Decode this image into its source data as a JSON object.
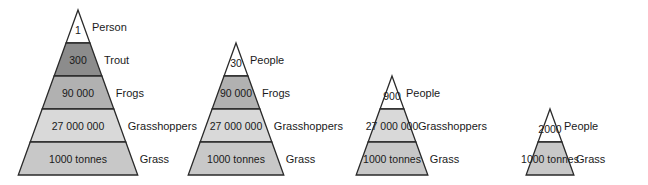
{
  "colors": {
    "outline": "#2a2a2a",
    "apex": "#ffffff",
    "trout": "#8c8c8c",
    "frogs": "#b1b1b1",
    "grasshoppers": "#d9d9d9",
    "grass": "#c8c8c8"
  },
  "pyramids": [
    {
      "id": "five-level",
      "apex_x": 78,
      "levels": [
        {
          "value": "1",
          "organism": "Person",
          "color_key": "apex"
        },
        {
          "value": "300",
          "organism": "Trout",
          "color_key": "trout"
        },
        {
          "value": "90 000",
          "organism": "Frogs",
          "color_key": "frogs"
        },
        {
          "value": "27 000 000",
          "organism": "Grasshoppers",
          "color_key": "grasshoppers"
        },
        {
          "value": "1000 tonnes",
          "organism": "Grass",
          "color_key": "grass"
        }
      ]
    },
    {
      "id": "four-level",
      "apex_x": 236,
      "levels": [
        {
          "value": "30",
          "organism": "People",
          "color_key": "apex"
        },
        {
          "value": "90 000",
          "organism": "Frogs",
          "color_key": "frogs"
        },
        {
          "value": "27 000 000",
          "organism": "Grasshoppers",
          "color_key": "grasshoppers"
        },
        {
          "value": "1000 tonnes",
          "organism": "Grass",
          "color_key": "grass"
        }
      ]
    },
    {
      "id": "three-level",
      "apex_x": 392,
      "levels": [
        {
          "value": "900",
          "organism": "People",
          "color_key": "apex"
        },
        {
          "value": "27 000 000",
          "organism": "Grasshoppers",
          "color_key": "grasshoppers"
        },
        {
          "value": "1000 tonnes",
          "organism": "Grass",
          "color_key": "grass"
        }
      ]
    },
    {
      "id": "two-level",
      "apex_x": 550,
      "levels": [
        {
          "value": "2000",
          "organism": "People",
          "color_key": "apex"
        },
        {
          "value": "1000 tonnes",
          "organism": "Grass",
          "color_key": "grass"
        }
      ]
    }
  ],
  "geometry": {
    "base_y": 175,
    "band_height": 33,
    "half_width_per_px": 0.362
  }
}
